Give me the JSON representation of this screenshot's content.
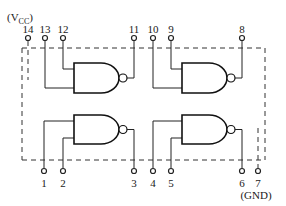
{
  "diagram": {
    "vcc_label_prefix": "(V",
    "vcc_label_sub": "CC",
    "vcc_label_suffix": ")",
    "gnd_label": "(GND)",
    "top_pins": [
      {
        "number": "14",
        "x": 28
      },
      {
        "number": "13",
        "x": 45
      },
      {
        "number": "12",
        "x": 63
      },
      {
        "number": "11",
        "x": 134
      },
      {
        "number": "10",
        "x": 153
      },
      {
        "number": "9",
        "x": 171
      },
      {
        "number": "8",
        "x": 242
      }
    ],
    "bottom_pins": [
      {
        "number": "1",
        "x": 44
      },
      {
        "number": "2",
        "x": 63
      },
      {
        "number": "3",
        "x": 134
      },
      {
        "number": "4",
        "x": 153
      },
      {
        "number": "5",
        "x": 171
      },
      {
        "number": "6",
        "x": 242
      },
      {
        "number": "7",
        "x": 258
      }
    ],
    "gates": [
      {
        "name": "gate-1",
        "type": "NAND",
        "inputs": [
          "1",
          "2"
        ],
        "output": "3"
      },
      {
        "name": "gate-2",
        "type": "NAND",
        "inputs": [
          "4",
          "5"
        ],
        "output": "6"
      },
      {
        "name": "gate-3",
        "type": "NAND",
        "inputs": [
          "9",
          "10"
        ],
        "output": "8"
      },
      {
        "name": "gate-4",
        "type": "NAND",
        "inputs": [
          "12",
          "13"
        ],
        "output": "11"
      }
    ]
  }
}
